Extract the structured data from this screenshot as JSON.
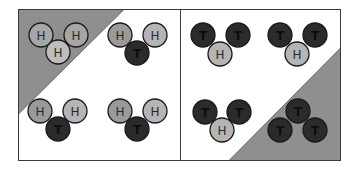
{
  "colors": {
    "background": "#ffffff",
    "panel_border": "#3a3a3a",
    "shade": "#8f8f8f",
    "H_fill_light": "#b5b5b5",
    "H_fill_mid": "#9a9a9a",
    "T_fill": "#2b2b2b",
    "H_label": "#2a2a2a",
    "T_label": "#0d0d0d"
  },
  "atoms": {
    "H": {
      "symbol": "H",
      "label": "H"
    },
    "T": {
      "symbol": "T",
      "label": "T"
    }
  },
  "panels": [
    {
      "name": "left-panel",
      "shaded_corner": "top-left",
      "molecules": [
        {
          "name": "H3",
          "atoms": [
            "H",
            "H",
            "H"
          ],
          "shaded": true
        },
        {
          "name": "H2T",
          "atoms": [
            "H",
            "H",
            "T"
          ],
          "shaded": false
        },
        {
          "name": "H2T",
          "atoms": [
            "H",
            "H",
            "T"
          ],
          "shaded": false
        },
        {
          "name": "H2T",
          "atoms": [
            "H",
            "H",
            "T"
          ],
          "shaded": false
        }
      ]
    },
    {
      "name": "right-panel",
      "shaded_corner": "bottom-right",
      "molecules": [
        {
          "name": "HT2",
          "atoms": [
            "T",
            "T",
            "H"
          ],
          "shaded": false
        },
        {
          "name": "HT2",
          "atoms": [
            "T",
            "T",
            "H"
          ],
          "shaded": false
        },
        {
          "name": "HT2",
          "atoms": [
            "T",
            "T",
            "H"
          ],
          "shaded": false
        },
        {
          "name": "T3",
          "atoms": [
            "T",
            "T",
            "T"
          ],
          "shaded": true
        }
      ]
    }
  ]
}
